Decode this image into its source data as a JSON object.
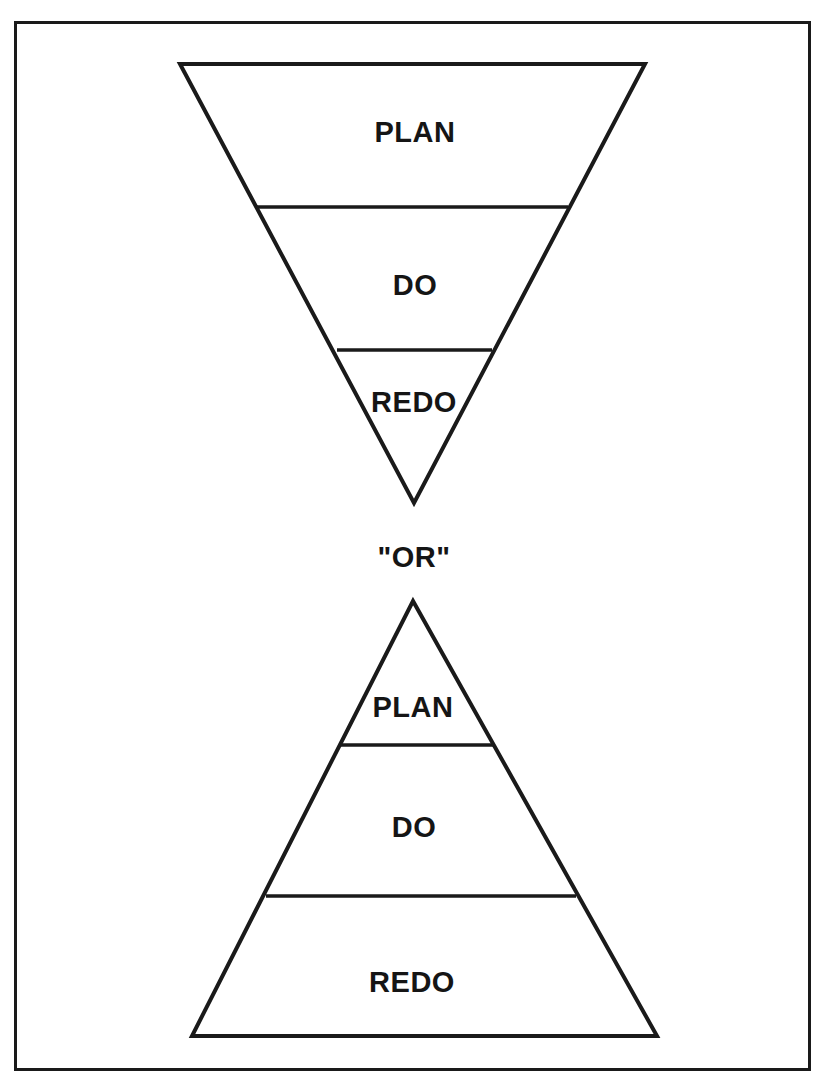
{
  "diagram": {
    "top_funnel": {
      "shape": "inverted-triangle",
      "sections": [
        {
          "label": "PLAN"
        },
        {
          "label": "DO"
        },
        {
          "label": "REDO"
        }
      ]
    },
    "separator": {
      "label": "\"OR\""
    },
    "bottom_pyramid": {
      "shape": "triangle",
      "sections": [
        {
          "label": "PLAN"
        },
        {
          "label": "DO"
        },
        {
          "label": "REDO"
        }
      ]
    },
    "colors": {
      "stroke": "#1a1a1a",
      "background": "#ffffff",
      "text": "#151515"
    }
  }
}
